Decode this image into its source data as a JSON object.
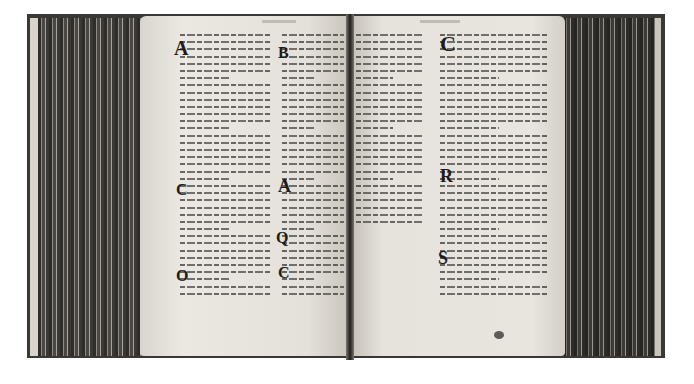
{
  "image": {
    "description": "Black-and-white photograph of an open medieval manuscript codex, two-column script on each page",
    "background_color": "#ffffff"
  },
  "spread": {
    "left_page": {
      "columns": 2,
      "running_head_legible": false,
      "initials": [
        {
          "letter": "A",
          "column": 1,
          "position": "top"
        },
        {
          "letter": "C",
          "column": 1,
          "position": "middle"
        },
        {
          "letter": "O",
          "column": 1,
          "position": "lower"
        },
        {
          "letter": "B",
          "column": 2,
          "position": "top"
        },
        {
          "letter": "A",
          "column": 2,
          "position": "middle"
        },
        {
          "letter": "Q",
          "column": 2,
          "position": "lower-middle"
        },
        {
          "letter": "C",
          "column": 2,
          "position": "lower"
        }
      ]
    },
    "right_page": {
      "columns": 2,
      "running_head_legible": false,
      "initials": [
        {
          "letter": "C",
          "column": 2,
          "position": "top"
        },
        {
          "letter": "R",
          "column": 2,
          "position": "middle"
        },
        {
          "letter": "S",
          "column": 2,
          "position": "lower"
        }
      ]
    },
    "text_legible": false
  }
}
